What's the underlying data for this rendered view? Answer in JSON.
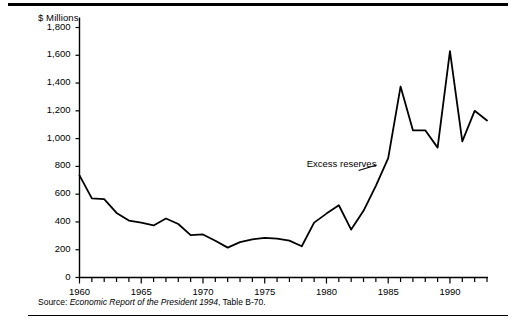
{
  "figure": {
    "unit_label": "$ Millions",
    "source": {
      "label": "Source:",
      "title": "Economic Report of the President 1994",
      "tail": ", Table B-70."
    }
  },
  "chart_data": {
    "type": "line",
    "title": "",
    "subtitle": "",
    "xlabel": "",
    "ylabel": "$ Millions",
    "xlim": [
      1960,
      1993
    ],
    "ylim": [
      0,
      1800
    ],
    "ytick_step": 200,
    "xtick_step": 1,
    "grid": false,
    "legend": false,
    "annotations": [
      {
        "text": "Excess reserves",
        "x": 1978.4,
        "y": 810,
        "leader_to_x": 1982.6,
        "leader_to_y": 770
      }
    ],
    "ytick_labels": [
      "0",
      "200",
      "400",
      "600",
      "800",
      "1,000",
      "1,200",
      "1,400",
      "1,600",
      "1,800"
    ],
    "ytick_values": [
      0,
      200,
      400,
      600,
      800,
      1000,
      1200,
      1400,
      1600,
      1800
    ],
    "xtick_labels": [
      "1960",
      "1965",
      "1970",
      "1975",
      "1980",
      "1985",
      "1990"
    ],
    "xtick_label_values": [
      1960,
      1965,
      1970,
      1975,
      1980,
      1985,
      1990
    ],
    "series": [
      {
        "name": "Excess reserves",
        "color": "#000000",
        "x": [
          1960,
          1961,
          1962,
          1963,
          1964,
          1965,
          1966,
          1967,
          1968,
          1969,
          1970,
          1971,
          1972,
          1973,
          1974,
          1975,
          1976,
          1977,
          1978,
          1979,
          1980,
          1981,
          1982,
          1983,
          1984,
          1985,
          1986,
          1987,
          1988,
          1989,
          1990,
          1991,
          1992,
          1993
        ],
        "values": [
          735,
          570,
          565,
          465,
          410,
          395,
          375,
          425,
          385,
          305,
          310,
          265,
          215,
          255,
          275,
          285,
          280,
          265,
          225,
          395,
          460,
          520,
          345,
          480,
          660,
          860,
          1375,
          1060,
          1060,
          935,
          1630,
          980,
          1200,
          1130
        ]
      }
    ]
  }
}
